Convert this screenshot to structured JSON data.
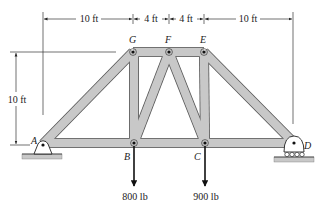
{
  "figure": {
    "type": "truss",
    "dimensions": {
      "top": [
        "10 ft",
        "4 ft",
        "4 ft",
        "10 ft"
      ],
      "height": "10 ft"
    },
    "joints": {
      "A": "A",
      "B": "B",
      "C": "C",
      "D": "D",
      "E": "E",
      "F": "F",
      "G": "G"
    },
    "loads": {
      "B": "800 lb",
      "C": "900 lb"
    },
    "members": [
      "AG",
      "GF",
      "FE",
      "ED",
      "AB",
      "BC",
      "CD",
      "GB",
      "FB",
      "FC",
      "EC"
    ],
    "supports": {
      "A": "pin",
      "D": "roller"
    },
    "colors": {
      "member_fill": "#c8c8c8",
      "member_stroke": "#555555",
      "line": "#222222"
    }
  }
}
